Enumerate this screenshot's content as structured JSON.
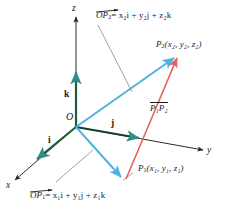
{
  "figure": {
    "colors": {
      "axis": "#1b5e3c",
      "position_vector": "#4db2e0",
      "displacement_vector": "#e8615a",
      "leader": "#8a8a8a",
      "text": "#1a1a1a",
      "background": "#ffffff"
    },
    "axes": [
      {
        "name": "x-axis",
        "label": "x"
      },
      {
        "name": "y-axis",
        "label": "y"
      },
      {
        "name": "z-axis",
        "label": "z"
      }
    ],
    "basis_vectors": [
      {
        "name": "i-hat",
        "label": "i"
      },
      {
        "name": "j-hat",
        "label": "j"
      },
      {
        "name": "k-hat",
        "label": "k"
      }
    ],
    "origin": {
      "label": "O"
    },
    "points": [
      {
        "name": "point-p1",
        "symbol": "P",
        "symbol_sub": "1",
        "coords_open": "(",
        "coords": "x₁, y₁, z₁",
        "coords_close": ")",
        "full_label": "P₁(x₁, y₁, z₁)"
      },
      {
        "name": "point-p2",
        "symbol": "P",
        "symbol_sub": "2",
        "coords_open": "(",
        "coords": "x₂, y₂, z₂",
        "coords_close": ")",
        "full_label": "P₂(x₂, y₂, z₂)"
      }
    ],
    "equations": {
      "op2": {
        "vector_head": "OP",
        "vector_head_sub": "2",
        "rhs": "= x₂i + y₂j + z₂k",
        "full": "OP₂ = x₂i + y₂j + z₂k"
      },
      "op1": {
        "vector_head": "OP",
        "vector_head_sub": "1",
        "rhs": "= x₁i + y₁j + z₁k",
        "full": "OP₁ = x₁i + y₁j + z₁k"
      }
    },
    "displacement_label": {
      "name": "vector-p1p2",
      "full": "P₁P₂"
    }
  }
}
